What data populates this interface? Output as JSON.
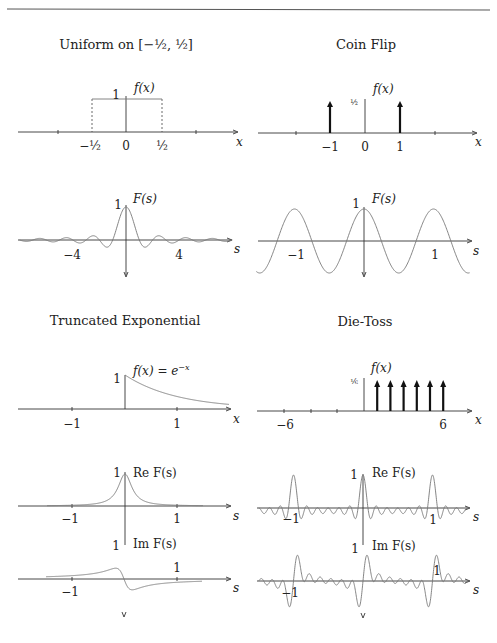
{
  "page": {
    "rule": true
  },
  "panels": {
    "uniform": {
      "title": "Uniform on [−½, ½]",
      "title_main": "Uniform on ",
      "title_interval": "[−½, ½]",
      "f_label": "f(x)",
      "one": "1",
      "x_var": "x",
      "ticks": [
        "−½",
        "0",
        "½"
      ],
      "F_label": "F(s)",
      "F_one": "1",
      "s_var": "s",
      "F_ticks": [
        "−4",
        "4"
      ]
    },
    "coin": {
      "title": "Coin Flip",
      "f_label": "f(x)",
      "half": "½",
      "x_var": "x",
      "ticks": [
        "−1",
        "0",
        "1"
      ],
      "F_label": "F(s)",
      "F_one": "1",
      "s_var": "s",
      "F_ticks": [
        "−1",
        "1"
      ]
    },
    "exponential": {
      "title": "Truncated Exponential",
      "f_label": "f(x) = e",
      "f_exp": "−x",
      "one": "1",
      "x_var": "x",
      "ticks": [
        "−1",
        "1"
      ],
      "re_label": "Re F(s)",
      "re_one": "1",
      "re_ticks": [
        "−1",
        "1"
      ],
      "im_label": "Im F(s)",
      "im_one": "1",
      "im_ticks": [
        "−1",
        "1"
      ],
      "s_var": "s"
    },
    "die": {
      "title": "Die-Toss",
      "f_label": "f(x)",
      "sixth": "⅙",
      "x_var": "x",
      "ticks": [
        "−6",
        "6"
      ],
      "re_label": "Re F(s)",
      "re_one": "1",
      "re_ticks": [
        "−1",
        "1"
      ],
      "im_label": "Im F(s)",
      "im_one": "1",
      "im_ticks": [
        "−1",
        "1"
      ],
      "s_var": "s"
    }
  },
  "chart_data": [
    {
      "type": "line",
      "title": "Uniform on [-1/2, 1/2]",
      "xlabel": "x",
      "ylabel": "f(x)",
      "x": [
        -0.5,
        -0.5,
        0.5,
        0.5
      ],
      "values": [
        0,
        1,
        1,
        0
      ],
      "xticks": [
        "-1/2",
        "0",
        "1/2"
      ],
      "yticks": [
        "1"
      ]
    },
    {
      "type": "line",
      "title": "Uniform transform",
      "xlabel": "s",
      "ylabel": "F(s)",
      "function": "sin(pi s)/(pi s)",
      "xlim": [
        -8,
        8
      ],
      "ylim": [
        -0.3,
        1
      ],
      "xticks": [
        "-4",
        "4"
      ],
      "yticks": [
        "1"
      ]
    },
    {
      "type": "bar",
      "title": "Coin Flip",
      "xlabel": "x",
      "ylabel": "f(x)",
      "categories": [
        "-1",
        "1"
      ],
      "values": [
        0.5,
        0.5
      ],
      "xticks": [
        "-1",
        "0",
        "1"
      ],
      "yticks": [
        "1/2"
      ]
    },
    {
      "type": "line",
      "title": "Coin Flip transform",
      "xlabel": "s",
      "ylabel": "F(s)",
      "function": "cos(2 pi s)",
      "xlim": [
        -1.6,
        1.6
      ],
      "ylim": [
        -1,
        1
      ],
      "xticks": [
        "-1",
        "1"
      ],
      "yticks": [
        "1"
      ]
    },
    {
      "type": "line",
      "title": "Truncated Exponential",
      "xlabel": "x",
      "ylabel": "f(x) = e^{-x}",
      "function": "e^{-x} for x >= 0",
      "xlim": [
        -1.5,
        1.5
      ],
      "ylim": [
        0,
        1
      ],
      "xticks": [
        "-1",
        "1"
      ],
      "yticks": [
        "1"
      ]
    },
    {
      "type": "line",
      "title": "Truncated Exponential transform (real)",
      "xlabel": "s",
      "ylabel": "Re F(s)",
      "function": "1/(1+4 pi^2 s^2)",
      "xlim": [
        -1.5,
        1.5
      ],
      "ylim": [
        0,
        1
      ],
      "xticks": [
        "-1",
        "1"
      ],
      "yticks": [
        "1"
      ]
    },
    {
      "type": "line",
      "title": "Truncated Exponential transform (imaginary)",
      "xlabel": "s",
      "ylabel": "Im F(s)",
      "function": "-2 pi s/(1+4 pi^2 s^2)",
      "xlim": [
        -1.5,
        1.5
      ],
      "ylim": [
        -0.5,
        0.5
      ],
      "xticks": [
        "-1",
        "1"
      ],
      "yticks": [
        "1"
      ]
    },
    {
      "type": "bar",
      "title": "Die-Toss",
      "xlabel": "x",
      "ylabel": "f(x)",
      "categories": [
        "1",
        "2",
        "3",
        "4",
        "5",
        "6"
      ],
      "values": [
        0.1667,
        0.1667,
        0.1667,
        0.1667,
        0.1667,
        0.1667
      ],
      "xticks": [
        "-6",
        "6"
      ],
      "yticks": [
        "1/6"
      ]
    },
    {
      "type": "line",
      "title": "Die-Toss transform (real)",
      "xlabel": "s",
      "ylabel": "Re F(s)",
      "function": "(1/6) sum_{k=1}^{6} cos(2 pi k s)",
      "xlim": [
        -1.5,
        1.5
      ],
      "ylim": [
        -0.3,
        1
      ],
      "xticks": [
        "-1",
        "1"
      ],
      "yticks": [
        "1"
      ]
    },
    {
      "type": "line",
      "title": "Die-Toss transform (imaginary)",
      "xlabel": "s",
      "ylabel": "Im F(s)",
      "function": "-(1/6) sum_{k=1}^{6} sin(2 pi k s)",
      "xlim": [
        -1.5,
        1.5
      ],
      "ylim": [
        -0.8,
        0.8
      ],
      "xticks": [
        "-1",
        "1"
      ],
      "yticks": [
        "1"
      ]
    }
  ]
}
